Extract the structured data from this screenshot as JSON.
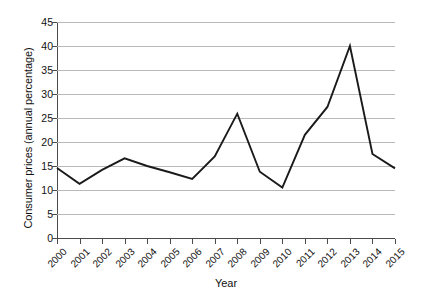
{
  "chart_data": {
    "type": "line",
    "title": "",
    "subtitle": "",
    "xlabel": "Year",
    "ylabel": "Consumer prices (annual percentage)",
    "categories": [
      "2000",
      "2001",
      "2002",
      "2003",
      "2004",
      "2005",
      "2006",
      "2007",
      "2008",
      "2009",
      "2010",
      "2011",
      "2012",
      "2013",
      "2014",
      "2015"
    ],
    "values": [
      14.6,
      11.3,
      14.2,
      16.6,
      15.0,
      13.7,
      12.3,
      17.0,
      25.9,
      13.8,
      10.5,
      21.5,
      27.3,
      40.0,
      17.5,
      14.5
    ],
    "series": [
      {
        "name": "Consumer prices (annual percentage)",
        "values": [
          14.6,
          11.3,
          14.2,
          16.6,
          15.0,
          13.7,
          12.3,
          17.0,
          25.9,
          13.8,
          10.5,
          21.5,
          27.3,
          40.0,
          17.5,
          14.5
        ]
      }
    ],
    "ylim": [
      0,
      45
    ],
    "xlim": [
      "2000",
      "2015"
    ],
    "ytick_labels": [
      "0",
      "5",
      "10",
      "15",
      "20",
      "25",
      "30",
      "35",
      "40",
      "45"
    ],
    "ytick_values": [
      0,
      5,
      10,
      15,
      20,
      25,
      30,
      35,
      40,
      45
    ],
    "xtick_labels": [
      "2000",
      "2001",
      "2002",
      "2003",
      "2004",
      "2005",
      "2006",
      "2007",
      "2008",
      "2009",
      "2010",
      "2011",
      "2012",
      "2013",
      "2014",
      "2015"
    ],
    "grid": "horizontal",
    "legend": "none",
    "line_color": "#1a1a1a",
    "grid_color": "#b9b9b9",
    "axis_color": "#4a4a4a",
    "background_color": "#ffffff",
    "annotations": []
  }
}
